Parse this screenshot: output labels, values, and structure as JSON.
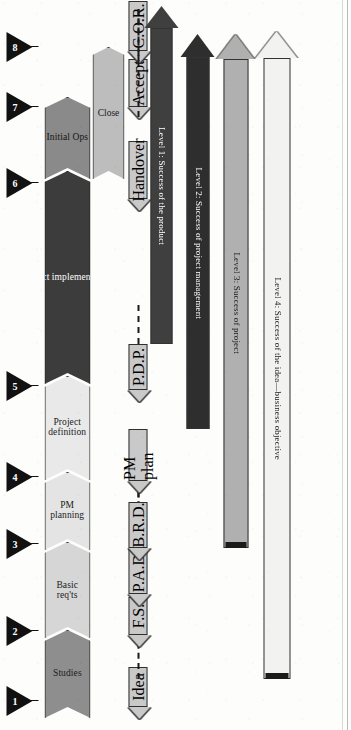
{
  "figure": {
    "orientation": "rotated-90-ccw"
  },
  "milestones": [
    {
      "id": "m1",
      "number": "1"
    },
    {
      "id": "m2",
      "number": "2"
    },
    {
      "id": "m3",
      "number": "3"
    },
    {
      "id": "m4",
      "number": "4"
    },
    {
      "id": "m5",
      "number": "5"
    },
    {
      "id": "m6",
      "number": "6"
    },
    {
      "id": "m7",
      "number": "7"
    },
    {
      "id": "m8",
      "number": "8"
    }
  ],
  "phases": [
    {
      "id": "studies",
      "label": "Studies",
      "color": "#8e8e8e",
      "text_color": "#1a1a1a"
    },
    {
      "id": "basic-reqts",
      "label": "Basic\nreq'ts",
      "color": "#d6d6d6",
      "text_color": "#1a1a1a"
    },
    {
      "id": "pm-planning",
      "label": "PM\nplanning",
      "color": "#e4e4e4",
      "text_color": "#1a1a1a"
    },
    {
      "id": "project-def",
      "label": "Project\ndefinition",
      "color": "#e9e9e9",
      "text_color": "#1a1a1a"
    },
    {
      "id": "project-impl",
      "label": "Project implementation",
      "color": "#3c3c3c",
      "text_color": "#ffffff"
    },
    {
      "id": "initial-ops",
      "label": "Initial Ops",
      "color": "#8a8a8a",
      "text_color": "#141414"
    }
  ],
  "close_lane": {
    "id": "close",
    "label": "Close",
    "color": "#bdbdbd",
    "text_color": "#1a1a1a"
  },
  "deliverables": [
    {
      "id": "idea",
      "label": "Idea",
      "connects_to": "level4"
    },
    {
      "id": "fs",
      "label": "F.S.",
      "connects_to": ""
    },
    {
      "id": "pad",
      "label": "P.A.D.",
      "connects_to": "level3"
    },
    {
      "id": "brd",
      "label": "B.R.D.",
      "connects_to": ""
    },
    {
      "id": "pmplan",
      "label": "PM plan",
      "connects_to": "level2"
    },
    {
      "id": "pdp",
      "label": "P.D.P.",
      "connects_to": "level1"
    },
    {
      "id": "handover",
      "label": "Handover",
      "connects_to": ""
    },
    {
      "id": "accept",
      "label": "Accept",
      "connects_to": "level2"
    },
    {
      "id": "cor",
      "label": "C.O.R.",
      "connects_to": "level1"
    }
  ],
  "levels": [
    {
      "id": "level1",
      "label": "Level 1: Success of the product",
      "color": "#3f3f3f",
      "text_color": "#ffffff"
    },
    {
      "id": "level2",
      "label": "Level 2: Success of project management",
      "color": "#2e2e2e",
      "text_color": "#ffffff"
    },
    {
      "id": "level3",
      "label": "Level 3: Success of project",
      "color": "#b0b0b0",
      "text_color": "#1a1a1a"
    },
    {
      "id": "level4",
      "label": "Level 4: Success of the idea—business objective",
      "color": "#f2f2f0",
      "text_color": "#1a1a1a"
    }
  ],
  "colors": {
    "outline": "#2a2a2a",
    "milestone": "#111111",
    "deliverable_fill": "#c9c9c9",
    "dash": "#1b1b1b",
    "page": "#fdfdfc"
  }
}
